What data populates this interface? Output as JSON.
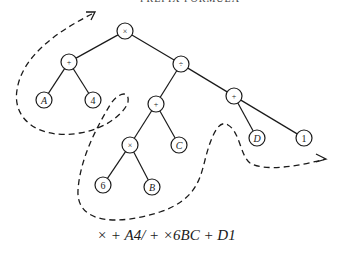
{
  "header": {
    "partial_title": "PREFIX FORMULA"
  },
  "tree": {
    "nodes": [
      {
        "id": "root",
        "label": "×",
        "x": 125,
        "y": 31,
        "italic": false,
        "small": true
      },
      {
        "id": "plus-left",
        "label": "+",
        "x": 69,
        "y": 62,
        "italic": false,
        "small": true
      },
      {
        "id": "divide",
        "label": "÷",
        "x": 181,
        "y": 64,
        "italic": false,
        "small": true
      },
      {
        "id": "A",
        "label": "A",
        "x": 44,
        "y": 100,
        "italic": true,
        "small": false
      },
      {
        "id": "four",
        "label": "4",
        "x": 93,
        "y": 100,
        "italic": false,
        "small": false
      },
      {
        "id": "plus-mid",
        "label": "+",
        "x": 156,
        "y": 104,
        "italic": false,
        "small": true
      },
      {
        "id": "plus-right",
        "label": "+",
        "x": 234,
        "y": 96,
        "italic": false,
        "small": true
      },
      {
        "id": "times-inner",
        "label": "×",
        "x": 130,
        "y": 145,
        "italic": false,
        "small": true
      },
      {
        "id": "C",
        "label": "C",
        "x": 179,
        "y": 145,
        "italic": true,
        "small": false
      },
      {
        "id": "six",
        "label": "6",
        "x": 103,
        "y": 185,
        "italic": false,
        "small": false
      },
      {
        "id": "B",
        "label": "B",
        "x": 152,
        "y": 187,
        "italic": true,
        "small": false
      },
      {
        "id": "D",
        "label": "D",
        "x": 257,
        "y": 138,
        "italic": true,
        "small": false
      },
      {
        "id": "one",
        "label": "1",
        "x": 304,
        "y": 138,
        "italic": false,
        "small": false
      }
    ],
    "edges": [
      [
        "root",
        "plus-left"
      ],
      [
        "root",
        "divide"
      ],
      [
        "plus-left",
        "A"
      ],
      [
        "plus-left",
        "four"
      ],
      [
        "divide",
        "plus-mid"
      ],
      [
        "divide",
        "plus-right"
      ],
      [
        "plus-mid",
        "times-inner"
      ],
      [
        "plus-mid",
        "C"
      ],
      [
        "times-inner",
        "six"
      ],
      [
        "times-inner",
        "B"
      ],
      [
        "plus-right",
        "D"
      ],
      [
        "plus-right",
        "one"
      ]
    ],
    "node_radius": 8
  },
  "traversal_path": {
    "style": "dashed",
    "direction": "start top-left arrow pointing inward, end right arrow pointing outward"
  },
  "expression": "× + A4/ + ×6BC + D1"
}
